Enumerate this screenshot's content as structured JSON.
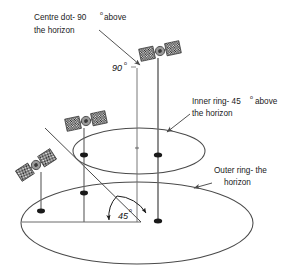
{
  "figure": {
    "background_color": "#ffffff",
    "line_color": "#4a4a4a",
    "text_color": "#1a1a1a",
    "satellite_panel_color": "#2b2b2b",
    "satellite_body_color": "#9a9a9a"
  },
  "annotations": {
    "centre_dot": {
      "line1_text": "Centre dot- 90",
      "line1_degree": "o",
      "line1_tail": "above",
      "line2_text": "the horizon"
    },
    "inner_ring": {
      "line1_text": "Inner ring- 45",
      "line1_degree": "o",
      "line1_tail": "above",
      "line2_text": "the horizon"
    },
    "outer_ring": {
      "line1_text": "Outer ring- the",
      "line2_text": "horizon"
    }
  },
  "labels": {
    "elevation_90": "90",
    "elevation_90_degree": "o",
    "angle_45": "45",
    "angle_45_degree": "o"
  },
  "geometry": {
    "outer_ring": {
      "cx": 137,
      "cy": 223,
      "rx": 116,
      "ry": 41
    },
    "inner_ring": {
      "cx": 139,
      "cy": 151,
      "rx": 66,
      "ry": 23
    },
    "centre_dot": {
      "cx": 137,
      "cy": 148
    },
    "baseline_y": 222,
    "poles": [
      {
        "name": "zenith-pole",
        "x": 137,
        "top": 68,
        "bottom": 222
      },
      {
        "name": "satellite-pole-right",
        "x": 158,
        "top": 58,
        "bottom": 222
      },
      {
        "name": "satellite-pole-mid",
        "x": 84,
        "top": 128,
        "bottom": 222
      },
      {
        "name": "satellite-pole-left",
        "x": 41,
        "top": 150,
        "bottom": 222
      }
    ],
    "markers": [
      {
        "name": "marker-right-inner",
        "x": 158,
        "y": 155
      },
      {
        "name": "marker-right-outer",
        "x": 158,
        "y": 221
      },
      {
        "name": "marker-mid-inner",
        "x": 84,
        "y": 155
      },
      {
        "name": "marker-mid-outer",
        "x": 84,
        "y": 193
      },
      {
        "name": "marker-left-outer",
        "x": 41,
        "y": 210
      }
    ],
    "satellites": [
      {
        "name": "satellite-top",
        "x": 160,
        "y": 51,
        "rotation": -12
      },
      {
        "name": "satellite-middle",
        "x": 86,
        "y": 121,
        "rotation": -12
      },
      {
        "name": "satellite-lower-left",
        "x": 35,
        "y": 165,
        "rotation": -32
      }
    ],
    "diagonal_line": {
      "x1": 45,
      "y1": 128,
      "x2": 140,
      "y2": 222
    }
  }
}
